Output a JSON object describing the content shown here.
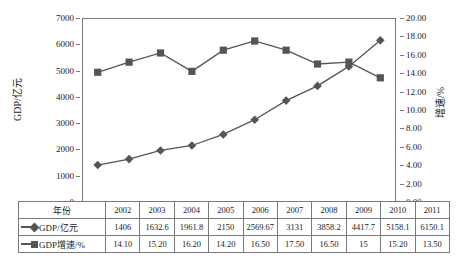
{
  "chart_data": {
    "type": "line",
    "title": "",
    "xlabel": "",
    "categories": [
      "2002",
      "2003",
      "2004",
      "2005",
      "2006",
      "2007",
      "2008",
      "2009",
      "2010",
      "2011"
    ],
    "series": [
      {
        "name": "GDP/亿元",
        "axis": "left",
        "marker": "diamond",
        "color": "#555555",
        "values": [
          1406,
          1632.6,
          1961.8,
          2150,
          2569.67,
          3131,
          3858.2,
          4417.7,
          5158.1,
          6150.1
        ],
        "labels": [
          "1406",
          "1632.6",
          "1961.8",
          "2150",
          "2569.67",
          "3131",
          "3858.2",
          "4417.7",
          "5158.1",
          "6150.1"
        ]
      },
      {
        "name": "GDP增速/%",
        "axis": "right",
        "marker": "square",
        "color": "#555555",
        "values": [
          14.1,
          15.2,
          16.2,
          14.2,
          16.5,
          17.5,
          16.5,
          15,
          15.2,
          13.5
        ],
        "labels": [
          "14.10",
          "15.20",
          "16.20",
          "14.20",
          "16.50",
          "17.50",
          "16.50",
          "15",
          "15.20",
          "13.50"
        ]
      }
    ],
    "left_axis": {
      "label": "GDP/亿元",
      "ylim": [
        0,
        7000
      ],
      "step": 1000,
      "ticks": [
        "0",
        "1000",
        "2000",
        "3000",
        "4000",
        "5000",
        "6000",
        "7000"
      ]
    },
    "right_axis": {
      "label": "增速/%",
      "ylim": [
        0,
        20
      ],
      "step": 2,
      "ticks": [
        "0.00",
        "2.00",
        "4.00",
        "6.00",
        "8.00",
        "10.00",
        "12.00",
        "14.00",
        "16.00",
        "18.00",
        "20.00"
      ]
    },
    "grid": false,
    "legend": "table"
  },
  "table": {
    "row_headers": [
      "年份",
      "GDP/亿元",
      "GDP增速/%"
    ],
    "rows": [
      {
        "header": "年份",
        "marker": "none",
        "cells": [
          "2002",
          "2003",
          "2004",
          "2005",
          "2006",
          "2007",
          "2008",
          "2009",
          "2010",
          "2011"
        ]
      },
      {
        "header": "GDP/亿元",
        "marker": "diamond",
        "cells": [
          "1406",
          "1632.6",
          "1961.8",
          "2150",
          "2569.67",
          "3131",
          "3858.2",
          "4417.7",
          "5158.1",
          "6150.1"
        ]
      },
      {
        "header": "GDP增速/%",
        "marker": "square",
        "cells": [
          "14.10",
          "15.20",
          "16.20",
          "14.20",
          "16.50",
          "17.50",
          "16.50",
          "15",
          "15.20",
          "13.50"
        ]
      }
    ]
  },
  "colors": {
    "series": "#555555",
    "axis": "#7a7a7a",
    "text": "#1a1a1a",
    "background": "#ffffff"
  }
}
